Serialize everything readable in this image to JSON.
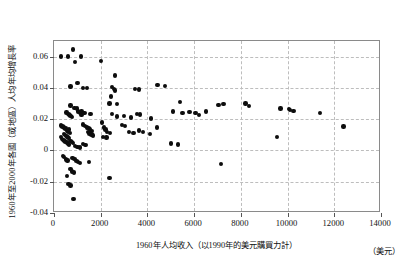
{
  "chart_data": {
    "type": "scatter",
    "title": "",
    "xlabel": "1960年人均收入（以1990年的美元購買力計）",
    "xunit": "（美元）",
    "ylabel": "1960年至2000年各國（或地區）人均年均增長率",
    "xlim": [
      0,
      14000
    ],
    "ylim": [
      -0.04,
      0.07
    ],
    "grid": true,
    "legend": null,
    "xticks": [
      0,
      2000,
      4000,
      6000,
      8000,
      10000,
      12000,
      14000
    ],
    "xticklabels": [
      "0",
      "2000",
      "4000",
      "6000",
      "8000",
      "10000",
      "12000",
      "14000"
    ],
    "yticks": [
      -0.04,
      -0.02,
      0,
      0.02,
      0.04,
      0.06
    ],
    "yticklabels": [
      "-0.04",
      "-0.02",
      "0",
      "0.02",
      "0.04",
      "0.06"
    ],
    "marker": "filled-circle",
    "marker_color": "#0d0d0d",
    "points": [
      [
        300,
        0.06
      ],
      [
        600,
        0.06
      ],
      [
        820,
        0.0645
      ],
      [
        900,
        0.0565
      ],
      [
        1150,
        0.06
      ],
      [
        2000,
        0.0572
      ],
      [
        2600,
        0.048
      ],
      [
        1000,
        0.0432
      ],
      [
        700,
        0.0408
      ],
      [
        1250,
        0.04
      ],
      [
        1400,
        0.0398
      ],
      [
        2480,
        0.0405
      ],
      [
        2560,
        0.0392
      ],
      [
        2620,
        0.0384
      ],
      [
        2450,
        0.0345
      ],
      [
        3480,
        0.0392
      ],
      [
        3640,
        0.039
      ],
      [
        4430,
        0.0418
      ],
      [
        4760,
        0.0412
      ],
      [
        2380,
        0.03
      ],
      [
        2700,
        0.0298
      ],
      [
        5400,
        0.031
      ],
      [
        7050,
        0.0292
      ],
      [
        7250,
        0.0296
      ],
      [
        8200,
        0.03
      ],
      [
        8350,
        0.0286
      ],
      [
        9700,
        0.0268
      ],
      [
        10050,
        0.0266
      ],
      [
        10100,
        0.0258
      ],
      [
        10250,
        0.0252
      ],
      [
        11400,
        0.024
      ],
      [
        9550,
        0.0088
      ],
      [
        12400,
        0.0152
      ],
      [
        700,
        0.0288
      ],
      [
        880,
        0.0272
      ],
      [
        980,
        0.0268
      ],
      [
        1180,
        0.025
      ],
      [
        530,
        0.0242
      ],
      [
        620,
        0.0235
      ],
      [
        660,
        0.0228
      ],
      [
        700,
        0.0222
      ],
      [
        760,
        0.0215
      ],
      [
        1020,
        0.0248
      ],
      [
        1100,
        0.0242
      ],
      [
        1180,
        0.0225
      ],
      [
        1300,
        0.024
      ],
      [
        1560,
        0.0232
      ],
      [
        2480,
        0.0235
      ],
      [
        2700,
        0.0218
      ],
      [
        3000,
        0.0222
      ],
      [
        3300,
        0.021
      ],
      [
        3560,
        0.0235
      ],
      [
        3680,
        0.023
      ],
      [
        4150,
        0.0205
      ],
      [
        5100,
        0.025
      ],
      [
        5500,
        0.024
      ],
      [
        5800,
        0.0245
      ],
      [
        6050,
        0.0238
      ],
      [
        6200,
        0.0228
      ],
      [
        6500,
        0.0248
      ],
      [
        300,
        0.016
      ],
      [
        360,
        0.0152
      ],
      [
        420,
        0.0148
      ],
      [
        470,
        0.0138
      ],
      [
        520,
        0.0145
      ],
      [
        560,
        0.0128
      ],
      [
        600,
        0.012
      ],
      [
        640,
        0.0135
      ],
      [
        680,
        0.0112
      ],
      [
        420,
        0.0105
      ],
      [
        480,
        0.0098
      ],
      [
        540,
        0.0092
      ],
      [
        580,
        0.0085
      ],
      [
        620,
        0.008
      ],
      [
        300,
        0.0088
      ],
      [
        350,
        0.0075
      ],
      [
        400,
        0.0068
      ],
      [
        450,
        0.006
      ],
      [
        500,
        0.0055
      ],
      [
        560,
        0.005
      ],
      [
        600,
        0.0042
      ],
      [
        650,
        0.0038
      ],
      [
        700,
        0.0062
      ],
      [
        760,
        0.0055
      ],
      [
        820,
        0.0048
      ],
      [
        1250,
        0.0165
      ],
      [
        1320,
        0.0158
      ],
      [
        1400,
        0.0148
      ],
      [
        1480,
        0.0142
      ],
      [
        1550,
        0.0135
      ],
      [
        1600,
        0.0125
      ],
      [
        1450,
        0.0118
      ],
      [
        1520,
        0.0108
      ],
      [
        1600,
        0.0102
      ],
      [
        1680,
        0.0095
      ],
      [
        2050,
        0.0178
      ],
      [
        2150,
        0.0148
      ],
      [
        2200,
        0.0135
      ],
      [
        2280,
        0.0118
      ],
      [
        2400,
        0.0112
      ],
      [
        2100,
        0.0088
      ],
      [
        2250,
        0.0082
      ],
      [
        2900,
        0.0162
      ],
      [
        3050,
        0.0155
      ],
      [
        3200,
        0.012
      ],
      [
        3400,
        0.0112
      ],
      [
        3650,
        0.0128
      ],
      [
        3800,
        0.0118
      ],
      [
        4100,
        0.0105
      ],
      [
        4400,
        0.0148
      ],
      [
        5000,
        0.0045
      ],
      [
        5300,
        0.0038
      ],
      [
        900,
        0.003
      ],
      [
        1000,
        0.0022
      ],
      [
        1100,
        0.0018
      ],
      [
        1250,
        0.0042
      ],
      [
        1350,
        0.0035
      ],
      [
        380,
        -0.0035
      ],
      [
        440,
        -0.0042
      ],
      [
        520,
        -0.0058
      ],
      [
        580,
        -0.0065
      ],
      [
        800,
        -0.0048
      ],
      [
        880,
        -0.0055
      ],
      [
        960,
        -0.0068
      ],
      [
        1020,
        -0.0075
      ],
      [
        1100,
        -0.0082
      ],
      [
        700,
        -0.012
      ],
      [
        780,
        -0.0135
      ],
      [
        860,
        -0.0142
      ],
      [
        560,
        -0.0165
      ],
      [
        1500,
        -0.0075
      ],
      [
        2380,
        -0.0175
      ],
      [
        620,
        -0.0215
      ],
      [
        700,
        -0.0225
      ],
      [
        7150,
        -0.0085
      ],
      [
        830,
        -0.031
      ]
    ]
  }
}
